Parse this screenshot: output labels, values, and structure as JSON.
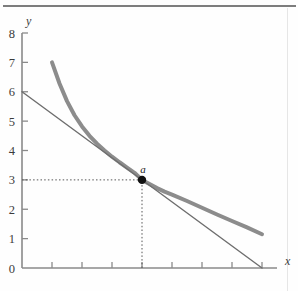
{
  "figure": {
    "background": "#fefefe",
    "rule_color": "#7d7d7d",
    "caption": ""
  },
  "axes": {
    "x_name": "x",
    "y_name": "y",
    "axis_color": "#8a8a8a",
    "x_ticks": [
      "0",
      "1",
      "2",
      "3",
      "4",
      "5",
      "6",
      "7",
      "8"
    ],
    "y_ticks": [
      "0",
      "1",
      "2",
      "3",
      "4",
      "5",
      "6",
      "7",
      "8"
    ]
  },
  "annotations": {
    "point_label": "a",
    "point_color": "#111111",
    "guide_color": "#555555"
  },
  "chart_data": {
    "type": "line",
    "title": "",
    "xlabel": "x",
    "ylabel": "y",
    "xlim": [
      0,
      8
    ],
    "ylim": [
      0,
      8
    ],
    "grid": false,
    "legend": "none",
    "series": [
      {
        "name": "indifference-curve",
        "style": "thick",
        "color": "#8c8c8c",
        "width": 4,
        "x": [
          1.0,
          1.25,
          1.5,
          1.75,
          2.0,
          2.25,
          2.5,
          2.75,
          3.0,
          3.25,
          3.5,
          3.75,
          4.0,
          4.25,
          4.5,
          4.75,
          5.0,
          5.5,
          6.0,
          6.5,
          7.0,
          7.5,
          8.0
        ],
        "y": [
          7.0,
          6.28,
          5.68,
          5.2,
          4.82,
          4.5,
          4.23,
          4.0,
          3.79,
          3.6,
          3.42,
          3.24,
          3.0,
          2.86,
          2.72,
          2.6,
          2.5,
          2.28,
          2.05,
          1.82,
          1.6,
          1.38,
          1.15
        ]
      },
      {
        "name": "budget-line",
        "style": "thin",
        "color": "#6e6e6e",
        "width": 1.4,
        "x": [
          0,
          8
        ],
        "y": [
          6,
          0
        ]
      }
    ],
    "points": [
      {
        "label": "a",
        "x": 4,
        "y": 3,
        "marker": "filled-circle",
        "color": "#111111"
      }
    ],
    "guides": [
      {
        "name": "horizontal-guide",
        "from": [
          0,
          3
        ],
        "to": [
          4,
          3
        ],
        "style": "dotted"
      },
      {
        "name": "vertical-guide",
        "from": [
          4,
          0
        ],
        "to": [
          4,
          3
        ],
        "style": "dotted"
      }
    ]
  }
}
